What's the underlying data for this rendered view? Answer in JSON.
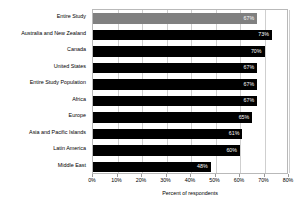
{
  "chart_data": {
    "type": "bar",
    "orientation": "horizontal",
    "title": "",
    "subtitle": "",
    "xlabel": "Percent of respondents",
    "ylabel": "",
    "xlim": [
      0,
      80
    ],
    "xtick_labels": [
      "0%",
      "10%",
      "20%",
      "30%",
      "40%",
      "50%",
      "60%",
      "70%",
      "80%"
    ],
    "xtick_values": [
      0,
      10,
      20,
      30,
      40,
      50,
      60,
      70,
      80
    ],
    "grid": true,
    "legend": false,
    "categories": [
      "Entire Study",
      "Australia and New Zealand",
      "Canada",
      "United States",
      "Entire Study Population",
      "Africa",
      "Europe",
      "Asia and Pacific Islands",
      "Latin America",
      "Middle East"
    ],
    "values": [
      67,
      73,
      70,
      67,
      67,
      67,
      65,
      61,
      60,
      48
    ],
    "value_labels": [
      "67%",
      "73%",
      "70%",
      "67%",
      "67%",
      "67%",
      "65%",
      "61%",
      "60%",
      "48%"
    ],
    "bar_colors": [
      "#808080",
      "#000000",
      "#000000",
      "#000000",
      "#000000",
      "#000000",
      "#000000",
      "#000000",
      "#000000",
      "#000000"
    ],
    "highlight_index": 0,
    "colors": {
      "bar_default": "#000000",
      "bar_highlight": "#808080",
      "grid": "#cfcfcf",
      "plot_border": "#b9b9b9",
      "value_label": "#ffffff",
      "background": "#ffffff"
    }
  }
}
